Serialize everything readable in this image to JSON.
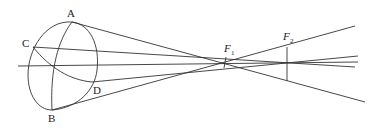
{
  "diagram": {
    "type": "optics-eye-astigmatism",
    "labels": {
      "A": "A",
      "B": "B",
      "C": "C",
      "D": "D",
      "F1": "F",
      "F1_sub": "1",
      "F2": "F",
      "F2_sub": "2"
    }
  }
}
